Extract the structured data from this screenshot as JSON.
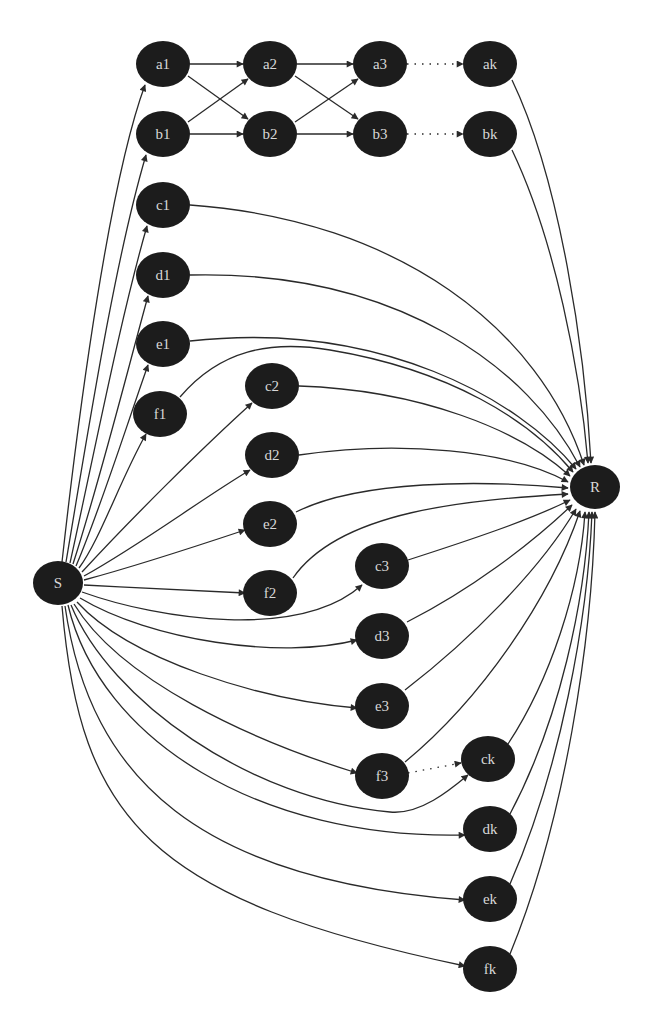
{
  "colors": {
    "node_fill": "#1c1c1c",
    "node_text": "#d8d8d8",
    "edge": "#2a2a2a",
    "background": "#ffffff"
  },
  "nodes": [
    {
      "id": "a1",
      "label": "a1",
      "x": 163,
      "y": 64
    },
    {
      "id": "a2",
      "label": "a2",
      "x": 270,
      "y": 64
    },
    {
      "id": "a3",
      "label": "a3",
      "x": 380,
      "y": 64
    },
    {
      "id": "ak",
      "label": "ak",
      "x": 490,
      "y": 64
    },
    {
      "id": "b1",
      "label": "b1",
      "x": 163,
      "y": 134
    },
    {
      "id": "b2",
      "label": "b2",
      "x": 270,
      "y": 134
    },
    {
      "id": "b3",
      "label": "b3",
      "x": 380,
      "y": 134
    },
    {
      "id": "bk",
      "label": "bk",
      "x": 490,
      "y": 134
    },
    {
      "id": "c1",
      "label": "c1",
      "x": 163,
      "y": 205
    },
    {
      "id": "d1",
      "label": "d1",
      "x": 163,
      "y": 275
    },
    {
      "id": "e1",
      "label": "e1",
      "x": 163,
      "y": 344
    },
    {
      "id": "f1",
      "label": "f1",
      "x": 160,
      "y": 414
    },
    {
      "id": "c2",
      "label": "c2",
      "x": 272,
      "y": 386
    },
    {
      "id": "d2",
      "label": "d2",
      "x": 272,
      "y": 455
    },
    {
      "id": "e2",
      "label": "e2",
      "x": 270,
      "y": 524
    },
    {
      "id": "f2",
      "label": "f2",
      "x": 270,
      "y": 593
    },
    {
      "id": "c3",
      "label": "c3",
      "x": 382,
      "y": 566
    },
    {
      "id": "d3",
      "label": "d3",
      "x": 382,
      "y": 636
    },
    {
      "id": "e3",
      "label": "e3",
      "x": 382,
      "y": 706
    },
    {
      "id": "f3",
      "label": "f3",
      "x": 382,
      "y": 776
    },
    {
      "id": "ck",
      "label": "ck",
      "x": 488,
      "y": 759
    },
    {
      "id": "dk",
      "label": "dk",
      "x": 490,
      "y": 829
    },
    {
      "id": "ek",
      "label": "ek",
      "x": 490,
      "y": 899
    },
    {
      "id": "fk",
      "label": "fk",
      "x": 490,
      "y": 969
    },
    {
      "id": "S",
      "label": "S",
      "x": 58,
      "y": 583
    },
    {
      "id": "R",
      "label": "R",
      "x": 595,
      "y": 487
    }
  ],
  "edges": [
    {
      "from": "S",
      "to": "a1",
      "d": "M62,562 C80,400 110,180 145,85"
    },
    {
      "from": "S",
      "to": "b1",
      "d": "M66,562 C90,420 115,260 146,155"
    },
    {
      "from": "S",
      "to": "c1",
      "d": "M70,563 C95,450 120,320 147,226"
    },
    {
      "from": "S",
      "to": "d1",
      "d": "M73,564 C100,480 125,380 148,296"
    },
    {
      "from": "S",
      "to": "e1",
      "d": "M76,566 C100,510 125,430 148,365"
    },
    {
      "from": "S",
      "to": "f1",
      "d": "M79,568 C100,540 120,480 146,434"
    },
    {
      "from": "S",
      "to": "c2",
      "d": "M82,572 C130,520 200,450 252,403"
    },
    {
      "from": "S",
      "to": "d2",
      "d": "M84,576 C140,545 200,500 250,470"
    },
    {
      "from": "S",
      "to": "e2",
      "d": "M84,580 C140,565 200,545 245,530"
    },
    {
      "from": "S",
      "to": "f2",
      "d": "M84,585 C140,588 200,591 245,593"
    },
    {
      "from": "S",
      "to": "c3",
      "d": "M82,592 C160,620 300,640 362,585"
    },
    {
      "from": "S",
      "to": "d3",
      "d": "M80,598 C150,640 280,660 357,640"
    },
    {
      "from": "S",
      "to": "e3",
      "d": "M77,602 C130,660 260,700 357,708"
    },
    {
      "from": "S",
      "to": "f3",
      "d": "M74,604 C120,680 250,740 357,773"
    },
    {
      "from": "S",
      "to": "ck",
      "d": "M71,605 C110,700 250,800 390,812 C420,815 450,790 468,775"
    },
    {
      "from": "S",
      "to": "dk",
      "d": "M68,605 C100,740 260,840 465,835"
    },
    {
      "from": "S",
      "to": "ek",
      "d": "M65,606 C90,780 200,880 465,900"
    },
    {
      "from": "S",
      "to": "fk",
      "d": "M62,606 C80,820 150,900 465,966"
    },
    {
      "from": "a1",
      "to": "a2",
      "d": "M190,64 L243,64"
    },
    {
      "from": "a2",
      "to": "a3",
      "d": "M297,64 L353,64"
    },
    {
      "from": "a3",
      "to": "ak",
      "d": "M407,64 L463,64",
      "dotted": true
    },
    {
      "from": "b1",
      "to": "b2",
      "d": "M190,134 L243,134"
    },
    {
      "from": "b2",
      "to": "b3",
      "d": "M297,134 L353,134"
    },
    {
      "from": "b3",
      "to": "bk",
      "d": "M407,134 L463,134",
      "dotted": true
    },
    {
      "from": "a1",
      "to": "b2",
      "d": "M188,76 L248,119"
    },
    {
      "from": "b1",
      "to": "a2",
      "d": "M188,122 L248,79"
    },
    {
      "from": "a2",
      "to": "b3",
      "d": "M295,76 L358,119"
    },
    {
      "from": "b2",
      "to": "a3",
      "d": "M295,122 L358,79"
    },
    {
      "from": "f3",
      "to": "ck",
      "d": "M408,773 L461,763",
      "dotted": true
    },
    {
      "from": "ak",
      "to": "R",
      "d": "M512,80 C560,180 585,350 591,463"
    },
    {
      "from": "bk",
      "to": "R",
      "d": "M512,150 C555,240 580,370 588,463"
    },
    {
      "from": "c1",
      "to": "R",
      "d": "M190,205 C400,220 540,330 584,465"
    },
    {
      "from": "d1",
      "to": "R",
      "d": "M190,275 C400,270 530,370 580,467"
    },
    {
      "from": "e1",
      "to": "R",
      "d": "M190,341 C380,320 520,400 576,469"
    },
    {
      "from": "f1",
      "to": "R",
      "d": "M180,397 C220,350 270,340 330,350 C450,370 530,420 573,472"
    },
    {
      "from": "c2",
      "to": "R",
      "d": "M299,386 C420,390 520,430 570,476"
    },
    {
      "from": "d2",
      "to": "R",
      "d": "M299,455 C400,440 510,450 568,482"
    },
    {
      "from": "e2",
      "to": "R",
      "d": "M296,512 C360,480 480,480 568,488"
    },
    {
      "from": "f2",
      "to": "R",
      "d": "M293,578 C340,510 470,500 568,494"
    },
    {
      "from": "c3",
      "to": "R",
      "d": "M408,560 C470,540 530,520 570,500"
    },
    {
      "from": "d3",
      "to": "R",
      "d": "M407,622 C470,590 530,545 572,505"
    },
    {
      "from": "e3",
      "to": "R",
      "d": "M405,690 C470,640 540,570 576,509"
    },
    {
      "from": "f3",
      "to": "R",
      "d": "M405,762 C480,700 550,600 580,511"
    },
    {
      "from": "ck",
      "to": "R",
      "d": "M508,744 C550,680 580,590 585,512"
    },
    {
      "from": "dk",
      "to": "R",
      "d": "M510,814 C560,720 585,600 589,512"
    },
    {
      "from": "ek",
      "to": "R",
      "d": "M510,884 C560,770 588,620 592,512"
    },
    {
      "from": "fk",
      "to": "R",
      "d": "M510,954 C565,820 592,640 595,512"
    }
  ]
}
